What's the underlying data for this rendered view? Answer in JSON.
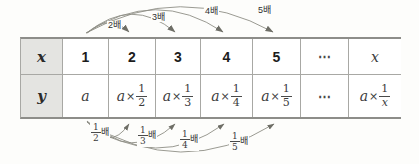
{
  "table": {
    "row_labels": {
      "x": "x",
      "y": "y"
    },
    "x_values": [
      "1",
      "2",
      "3",
      "4",
      "5",
      "⋯",
      "x"
    ],
    "y_cells": [
      {
        "text": "a"
      },
      {
        "var": "a",
        "op": "×",
        "num": "1",
        "den": "2"
      },
      {
        "var": "a",
        "op": "×",
        "num": "1",
        "den": "3"
      },
      {
        "var": "a",
        "op": "×",
        "num": "1",
        "den": "4"
      },
      {
        "var": "a",
        "op": "×",
        "num": "1",
        "den": "5"
      },
      {
        "text": "⋯"
      },
      {
        "var": "a",
        "op": "×",
        "num": "1",
        "den": "x"
      }
    ]
  },
  "top_arrows": [
    {
      "label": "2배"
    },
    {
      "label": "3배"
    },
    {
      "label": "4배"
    },
    {
      "label": "5배"
    }
  ],
  "bottom_arrows": [
    {
      "num": "1",
      "den": "2",
      "suffix": "배"
    },
    {
      "num": "1",
      "den": "3",
      "suffix": "배"
    },
    {
      "num": "1",
      "den": "4",
      "suffix": "배"
    },
    {
      "num": "1",
      "den": "5",
      "suffix": "배"
    }
  ],
  "colors": {
    "header-bg": "#e4e4e1",
    "border-thin": "#a8a8a4",
    "border-thick": "#8d8d89",
    "arrow": "#8f8f86",
    "arrow-head": "#6e6e66",
    "ink": "#1c1c1c",
    "math": "#3b3b3b",
    "canvas-bg": "#fdfdfb"
  }
}
